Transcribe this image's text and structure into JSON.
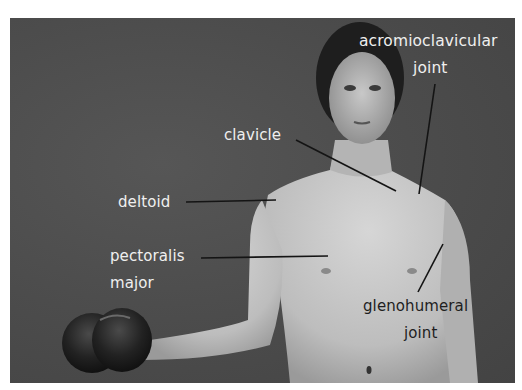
{
  "figure": {
    "background_color": "#4a4a4a",
    "skin_color": "#c9c9c9",
    "hair_color": "#1e1e1e",
    "label_light_color": "#efefef",
    "label_dark_color": "#1e1e1e",
    "leader_line_color": "#141414"
  },
  "labels": {
    "acromioclavicular_line1": "acromioclavicular",
    "acromioclavicular_line2": "joint",
    "clavicle": "clavicle",
    "deltoid": "deltoid",
    "pectoralis_line1": "pectoralis",
    "pectoralis_line2": "major",
    "glenohumeral_line1": "glenohumeral",
    "glenohumeral_line2": "joint"
  }
}
